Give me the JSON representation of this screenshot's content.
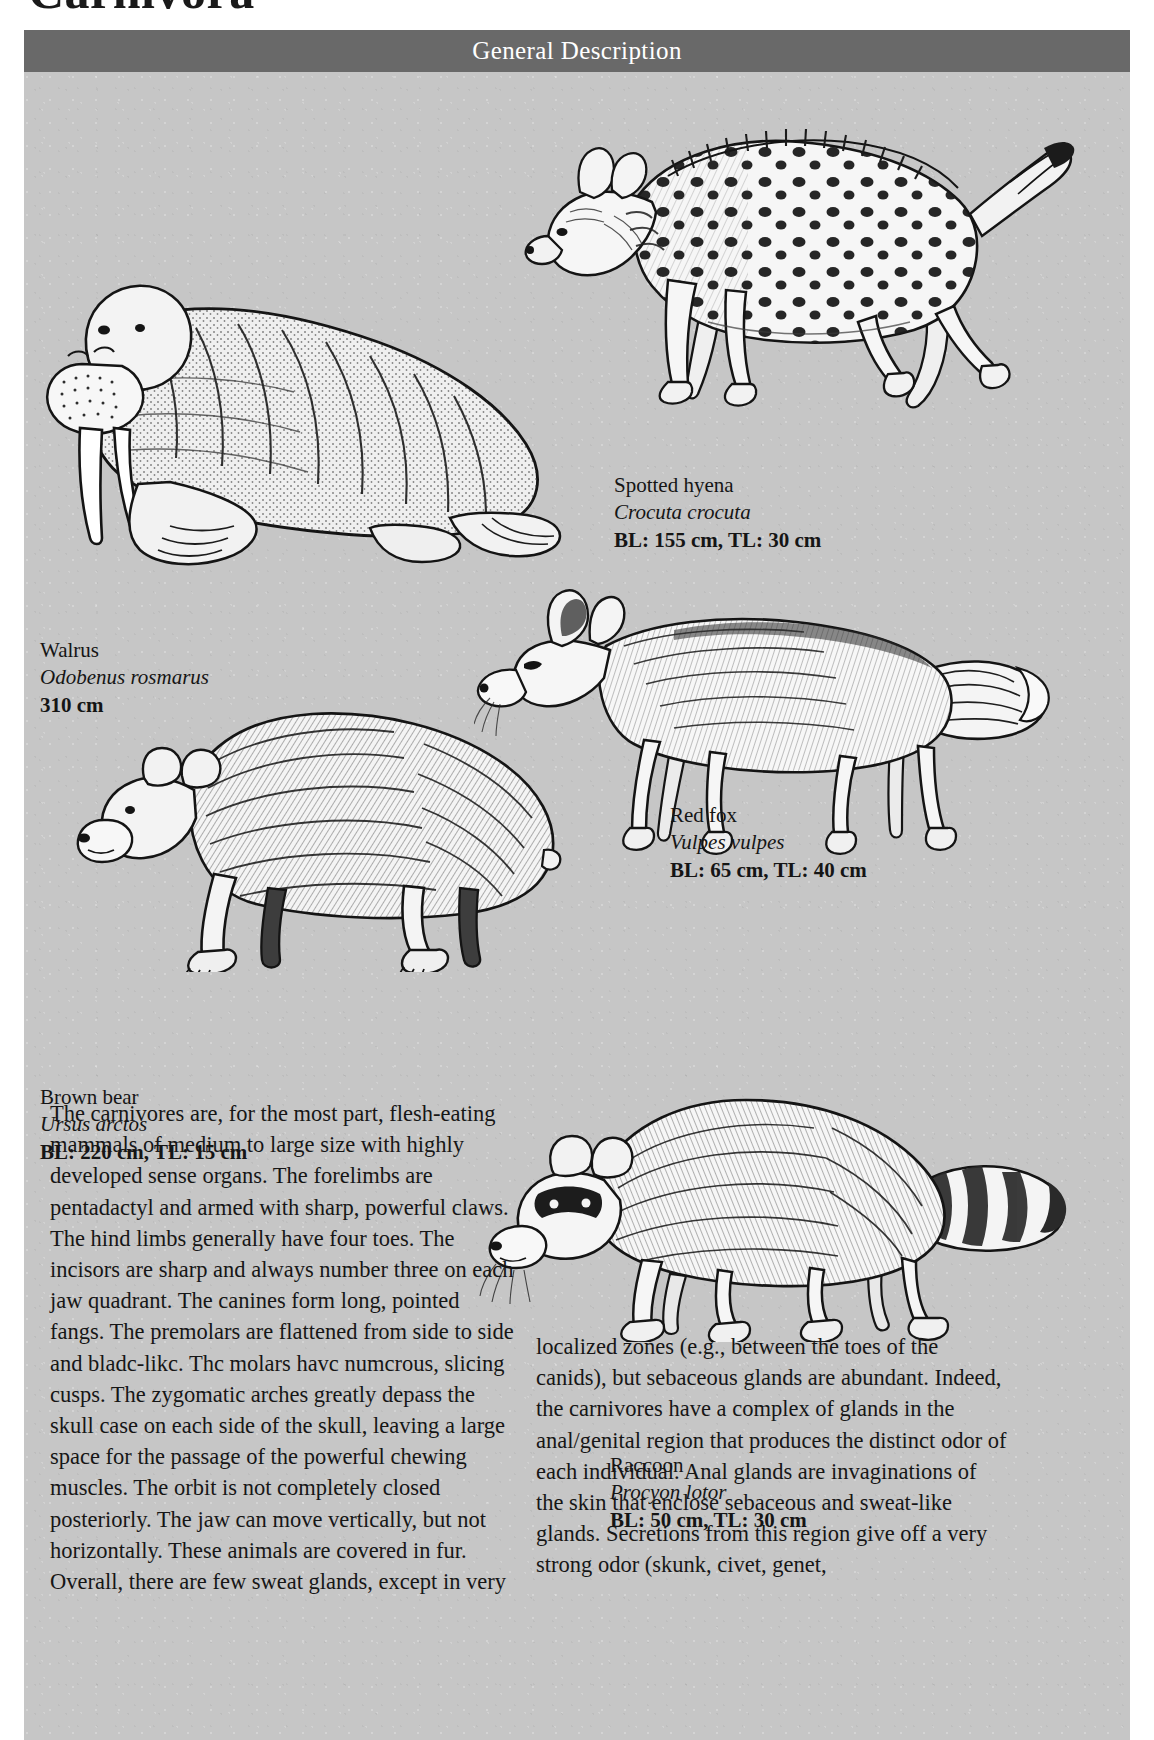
{
  "page": {
    "title": "Carnivora",
    "header_title": "General Description",
    "plate_background": "#c6c6c6",
    "header_background": "#696969"
  },
  "figures": [
    {
      "id": "spotted-hyena",
      "icon": "spotted-hyena-illustration",
      "common": "Spotted hyena",
      "latin": "Crocuta crocuta",
      "measure": "BL: 155 cm, TL: 30 cm"
    },
    {
      "id": "walrus",
      "icon": "walrus-illustration",
      "common": "Walrus",
      "latin": "Odobenus rosmarus",
      "measure": "310 cm"
    },
    {
      "id": "red-fox",
      "icon": "red-fox-illustration",
      "common": "Red fox",
      "latin": "Vulpes vulpes",
      "measure": "BL: 65 cm, TL: 40 cm"
    },
    {
      "id": "brown-bear",
      "icon": "brown-bear-illustration",
      "common": "Brown bear",
      "latin": "Ursus arctos",
      "measure": "BL: 220 cm, TL: 15 cm"
    },
    {
      "id": "raccoon",
      "icon": "raccoon-illustration",
      "common": "Raccoon",
      "latin": "Procyon lotor",
      "measure": "BL: 50 cm, TL: 30 cm"
    }
  ],
  "body": {
    "column_left": "The carnivores are, for the most part, flesh-eating mammals of medium to large size with highly developed sense organs. The forelimbs are pentadactyl and armed with sharp, powerful claws. The hind limbs generally have four toes. The incisors are sharp and always number three on each jaw quadrant. The canines form long, pointed fangs. The premolars are flattened from side to side and bladc-likc. Thc molars havc numcrous, slicing cusps. The zygomatic arches greatly depass the skull case on each side of the skull, leaving a large space for the passage of the powerful chewing muscles. The orbit is not completely closed posteriorly. The jaw can move vertically, but not horizontally. These animals are covered in fur. Overall, there are few sweat glands, except in very",
    "column_right": "localized zones (e.g., between the toes of the canids), but sebaceous glands are abundant. Indeed, the carnivores have a complex of glands in the anal/genital region that produces the distinct odor of each individual. Anal glands are invaginations of the skin that enclose sebaceous and sweat-like glands. Secretions from this region give off a very strong odor (skunk, civet, genet,"
  }
}
